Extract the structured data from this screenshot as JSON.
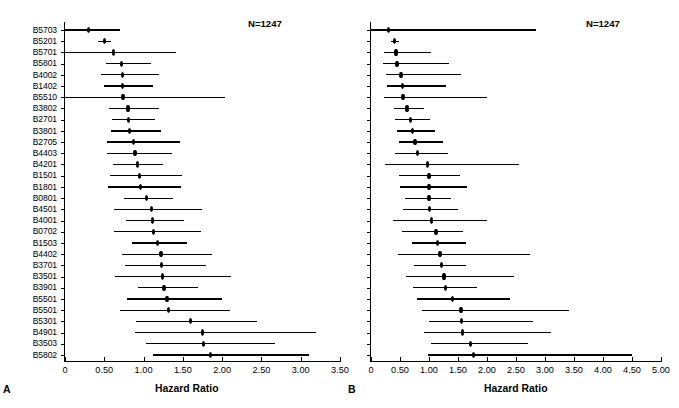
{
  "figure": {
    "n_label": "N=1247",
    "axis_title": "Hazard Ratio",
    "panel_a_letter": "A",
    "panel_b_letter": "B"
  },
  "chart_data": [
    {
      "type": "scatter",
      "subtype": "forest-plot",
      "panel": "A",
      "title": "",
      "annotation": "N=1247",
      "xlabel": "Hazard Ratio",
      "ylabel": "",
      "xlim": [
        0,
        3.5
      ],
      "grid": false,
      "legend": null,
      "xticks": [
        0,
        0.5,
        1.0,
        1.5,
        2.0,
        2.5,
        3.0,
        3.5
      ],
      "xticklabels": [
        "0",
        "0.50",
        "1.00",
        "1.50",
        "2.00",
        "2.50",
        "3.00",
        "3.50"
      ],
      "categories": [
        "B5703",
        "B5701",
        "B5201",
        "B5101",
        "B1402",
        "B4403",
        "B4201",
        "B2705",
        "B1501",
        "B1302",
        "B3901",
        "B3801",
        "B1801",
        "B1503",
        "B4002",
        "B0801",
        "B5801",
        "B5501",
        "B4001",
        "B4402",
        "B4501",
        "B5301",
        "B1510",
        "B0702",
        "B3701",
        "B3501",
        "B4901",
        "B5802",
        "B3501",
        "B5001"
      ],
      "values": [
        0.3,
        0.5,
        0.62,
        0.72,
        0.73,
        0.73,
        0.74,
        0.8,
        0.81,
        0.82,
        0.87,
        0.89,
        0.92,
        0.95,
        0.96,
        1.04,
        1.1,
        1.11,
        1.13,
        1.18,
        1.22,
        1.23,
        1.24,
        1.26,
        1.3,
        1.32,
        1.6,
        1.75,
        1.76,
        1.85
      ],
      "ci_low": [
        0.0,
        0.42,
        0.0,
        0.52,
        0.46,
        0.49,
        0.0,
        0.56,
        0.6,
        0.58,
        0.53,
        0.54,
        0.61,
        0.57,
        0.55,
        0.75,
        0.62,
        0.78,
        0.62,
        0.85,
        0.73,
        0.76,
        0.64,
        0.93,
        0.79,
        0.7,
        0.9,
        0.89,
        1.03,
        1.12
      ],
      "ci_high": [
        0.7,
        0.58,
        1.41,
        1.1,
        1.2,
        1.12,
        2.03,
        1.19,
        1.15,
        1.22,
        1.46,
        1.36,
        1.25,
        1.49,
        1.48,
        1.38,
        1.74,
        1.52,
        1.73,
        1.55,
        1.87,
        1.8,
        2.11,
        1.69,
        2.0,
        2.1,
        2.44,
        3.2,
        2.67,
        3.11
      ]
    },
    {
      "type": "scatter",
      "subtype": "forest-plot",
      "panel": "B",
      "title": "",
      "annotation": "N=1247",
      "xlabel": "Hazard Ratio",
      "ylabel": "",
      "xlim": [
        0,
        5.0
      ],
      "grid": false,
      "legend": null,
      "xticks": [
        0,
        0.5,
        1.0,
        1.5,
        2.0,
        2.5,
        3.0,
        3.5,
        4.0,
        4.5,
        5.0
      ],
      "xticklabels": [
        "0",
        "0.50",
        "1.00",
        "1.50",
        "2.00",
        "2.50",
        "3.00",
        "3.50",
        "4.00",
        "4.50",
        "5.00"
      ],
      "categories": [
        "B5703",
        "B5201",
        "B5701",
        "B5801",
        "B4002",
        "B1402",
        "B5510",
        "B3802",
        "B2701",
        "B3801",
        "B2705",
        "B4403",
        "B4201",
        "B1501",
        "B1801",
        "B0801",
        "B4501",
        "B4001",
        "B0702",
        "B1503",
        "B4402",
        "B3701",
        "B3501",
        "B3901",
        "B5501",
        "B5501",
        "B5301",
        "B4901",
        "B3503",
        "B5802"
      ],
      "values": [
        0.3,
        0.4,
        0.43,
        0.45,
        0.52,
        0.54,
        0.55,
        0.62,
        0.68,
        0.72,
        0.76,
        0.8,
        0.97,
        1.0,
        1.0,
        1.0,
        1.01,
        1.04,
        1.12,
        1.15,
        1.19,
        1.22,
        1.26,
        1.28,
        1.4,
        1.55,
        1.56,
        1.58,
        1.72,
        1.77
      ],
      "ci_low": [
        0.0,
        0.34,
        0.22,
        0.2,
        0.26,
        0.27,
        0.23,
        0.4,
        0.42,
        0.45,
        0.48,
        0.41,
        0.24,
        0.49,
        0.5,
        0.58,
        0.55,
        0.38,
        0.53,
        0.71,
        0.46,
        0.74,
        0.6,
        0.72,
        0.8,
        0.88,
        1.0,
        0.91,
        1.04,
        0.99
      ],
      "ci_high": [
        2.85,
        0.48,
        1.04,
        1.35,
        1.56,
        1.3,
        2.0,
        0.92,
        1.01,
        1.1,
        1.24,
        1.32,
        2.55,
        1.54,
        1.66,
        1.38,
        1.5,
        2.0,
        1.58,
        1.64,
        2.75,
        1.64,
        2.47,
        1.82,
        2.4,
        3.42,
        2.8,
        3.1,
        2.7,
        4.5
      ]
    }
  ]
}
